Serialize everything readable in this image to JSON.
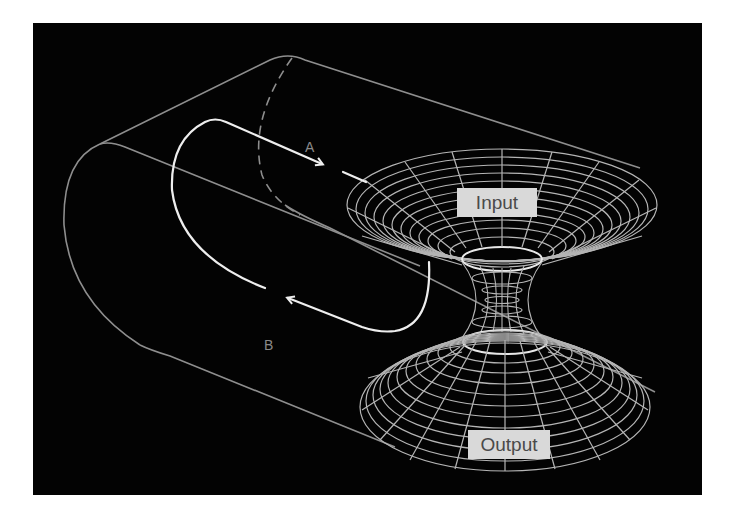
{
  "diagram": {
    "background_color": "#030303",
    "line_color": "#9a9a9a",
    "arrow_color": "#eeeeee",
    "labels": {
      "input": "Input",
      "output": "Output",
      "path_a": "A",
      "path_b": "B"
    },
    "elements": [
      {
        "type": "cylinder",
        "description": "Rounded cylinder outline with a dashed cross-section"
      },
      {
        "type": "closed-loop-path",
        "description": "Loop path with arrow A heading right and arrow B heading left"
      },
      {
        "type": "wormhole-surface",
        "description": "Hourglass wireframe funnel connecting Input (top) to Output (bottom)"
      }
    ]
  }
}
